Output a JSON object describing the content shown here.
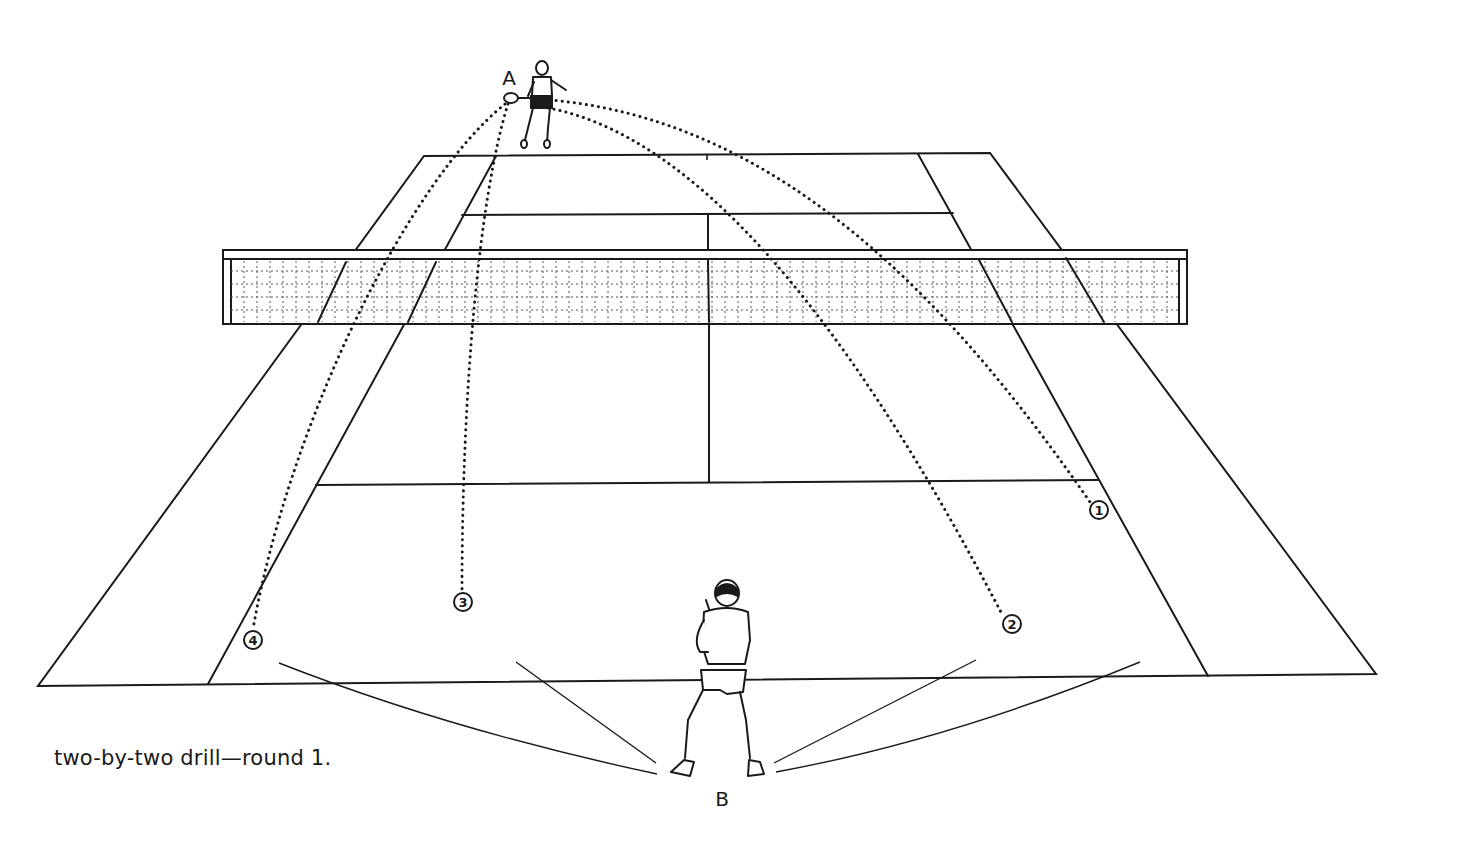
{
  "caption": "two-by-two drill—round 1.",
  "players": {
    "A": {
      "label": "A",
      "role": "hitter",
      "position": "far baseline"
    },
    "B": {
      "label": "B",
      "role": "receiver",
      "position": "near baseline"
    }
  },
  "targets": [
    {
      "id": "1",
      "label": "1",
      "x": 1099,
      "y": 510
    },
    {
      "id": "2",
      "label": "2",
      "x": 1012,
      "y": 624
    },
    {
      "id": "3",
      "label": "3",
      "x": 463,
      "y": 602
    },
    {
      "id": "4",
      "label": "4",
      "x": 253,
      "y": 640
    }
  ],
  "colors": {
    "ink": "#1a1a1a",
    "background": "#ffffff"
  }
}
